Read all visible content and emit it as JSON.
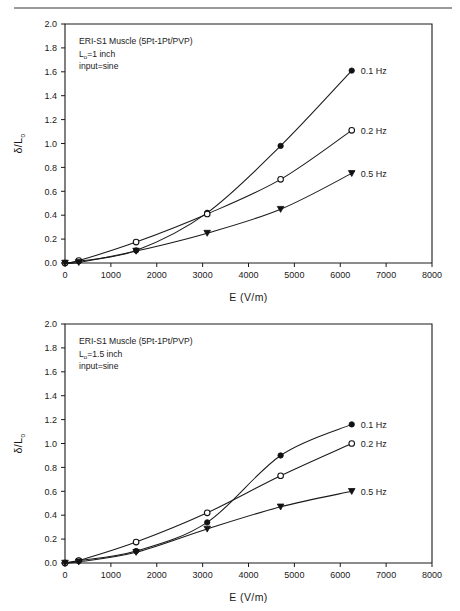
{
  "figure": {
    "panel_count": 2,
    "has_top_rule": true
  },
  "chart_data": [
    {
      "type": "line",
      "panel": "top",
      "title": "",
      "xlabel": "E (V/m)",
      "ylabel": "δ/L",
      "ylabel_sub": "o",
      "xlim": [
        0,
        8000
      ],
      "ylim": [
        0,
        2.0
      ],
      "xticks": [
        0,
        1000,
        2000,
        3000,
        4000,
        5000,
        6000,
        7000,
        8000
      ],
      "xticklabels": [
        "0",
        "1000",
        "2000",
        "3000",
        "4000",
        "5000",
        "6000",
        "7000",
        "8000"
      ],
      "yticks": [
        0.0,
        0.2,
        0.4,
        0.6,
        0.8,
        1.0,
        1.2,
        1.4,
        1.6,
        1.8,
        2.0
      ],
      "yticklabels": [
        "0.0",
        "0.2",
        "0.4",
        "0.6",
        "0.8",
        "1.0",
        "1.2",
        "1.4",
        "1.6",
        "1.8",
        "2.0"
      ],
      "grid": false,
      "legend_position": "right-of-line-ends",
      "annotations": [
        {
          "text": "ERI-S1 Muscle (5Pt-1Pt/PVP)"
        },
        {
          "text": "L",
          "sub": "o",
          "rest": "=1 inch"
        },
        {
          "text": "input=sine"
        }
      ],
      "annotation_lines": [
        "ERI-S1 Muscle (5Pt-1Pt/PVP)",
        "Lₒ=1 inch",
        "input=sine"
      ],
      "x": [
        0,
        300,
        1550,
        3100,
        4700,
        6250
      ],
      "series": [
        {
          "name": "0.1 Hz",
          "marker": "filled-circle",
          "values": [
            0.0,
            0.015,
            0.105,
            0.42,
            0.98,
            1.61
          ]
        },
        {
          "name": "0.2 Hz",
          "marker": "open-circle",
          "values": [
            0.0,
            0.02,
            0.175,
            0.41,
            0.7,
            1.11
          ]
        },
        {
          "name": "0.5 Hz",
          "marker": "filled-triangle",
          "values": [
            0.0,
            0.005,
            0.1,
            0.25,
            0.45,
            0.75
          ]
        }
      ]
    },
    {
      "type": "line",
      "panel": "bottom",
      "title": "",
      "xlabel": "E (V/m)",
      "ylabel": "δ/L",
      "ylabel_sub": "o",
      "xlim": [
        0,
        8000
      ],
      "ylim": [
        0,
        2.0
      ],
      "xticks": [
        0,
        1000,
        2000,
        3000,
        4000,
        5000,
        6000,
        7000,
        8000
      ],
      "xticklabels": [
        "0",
        "1000",
        "2000",
        "3000",
        "4000",
        "5000",
        "6000",
        "7000",
        "8000"
      ],
      "yticks": [
        0.0,
        0.2,
        0.4,
        0.6,
        0.8,
        1.0,
        1.2,
        1.4,
        1.6,
        1.8,
        2.0
      ],
      "yticklabels": [
        "0.0",
        "0.2",
        "0.4",
        "0.6",
        "0.8",
        "1.0",
        "1.2",
        "1.4",
        "1.6",
        "1.8",
        "2.0"
      ],
      "grid": false,
      "legend_position": "right-of-line-ends",
      "annotation_lines": [
        "ERI-S1 Muscle (5Pt-1Pt/PVP)",
        "Lₒ=1.5 inch",
        "input=sine"
      ],
      "x": [
        0,
        300,
        1550,
        3100,
        4700,
        6250
      ],
      "series": [
        {
          "name": "0.1 Hz",
          "marker": "filled-circle",
          "values": [
            0.0,
            0.02,
            0.1,
            0.34,
            0.9,
            1.16
          ]
        },
        {
          "name": "0.2 Hz",
          "marker": "open-circle",
          "values": [
            0.0,
            0.02,
            0.175,
            0.42,
            0.73,
            1.0
          ]
        },
        {
          "name": "0.5 Hz",
          "marker": "filled-triangle",
          "values": [
            0.0,
            0.01,
            0.09,
            0.285,
            0.47,
            0.6
          ]
        }
      ]
    }
  ],
  "colors": {
    "ink": "#1a1a1a",
    "line": "#111111",
    "background": "#ffffff",
    "rule": "#9a9a9a"
  }
}
